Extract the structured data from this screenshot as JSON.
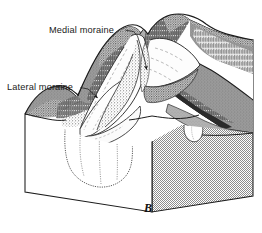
{
  "figure": {
    "panel_letter": "B",
    "caption_absent": true,
    "type": "geologic block diagram"
  },
  "labels": [
    {
      "id": "medial-moraine",
      "text": "Medial moraine",
      "text_x": 49,
      "text_y": 33,
      "anchor": "start",
      "leader": "M 125.5 30.2 L 133.5 31.5 L 137.5 36.0 L 141.5 49.0 L 145.0 61.0 L 146.6 69.5",
      "arrow_x": 146.8,
      "arrow_y": 71.0,
      "arrow_rot": 255
    },
    {
      "id": "lateral-moraine",
      "text": "Lateral moraine",
      "text_x": 7,
      "text_y": 90,
      "anchor": "start",
      "leader": "M 80.5 87.5 L 88.0 89.0 L 93.0 93.5 L 97.5 98.0",
      "arrow_x": 98.6,
      "arrow_y": 99.2,
      "arrow_rot": 310
    }
  ],
  "colors": {
    "ink": "#1b1b1b",
    "paper": "#ffffff",
    "cut_face_gray": "#b9b9b9",
    "cut_face_gray_dark": "#a3a3a3",
    "ridge_gray": "#8e8e8e",
    "ridge_gray_light": "#a8a8a8",
    "slope_dark": "#3a3a3a",
    "ice_white": "#fbfbfb",
    "shadow_gray": "#6f6f6f"
  },
  "features": [
    {
      "name": "block-front-face",
      "shading": "white"
    },
    {
      "name": "block-right-face",
      "shading": "stipple-gray"
    },
    {
      "name": "u-shaped-valley-cross-section",
      "shading": "white with stipple edge"
    },
    {
      "name": "glacier-ice-tongue",
      "shading": "white"
    },
    {
      "name": "medial-moraine-ridge",
      "shading": "stipple line on ice"
    },
    {
      "name": "lateral-moraine-ridge",
      "shading": "dark stipple band"
    },
    {
      "name": "mountain-slopes",
      "shading": "dark hachure"
    },
    {
      "name": "hanging-valley",
      "shading": "stipple"
    }
  ]
}
